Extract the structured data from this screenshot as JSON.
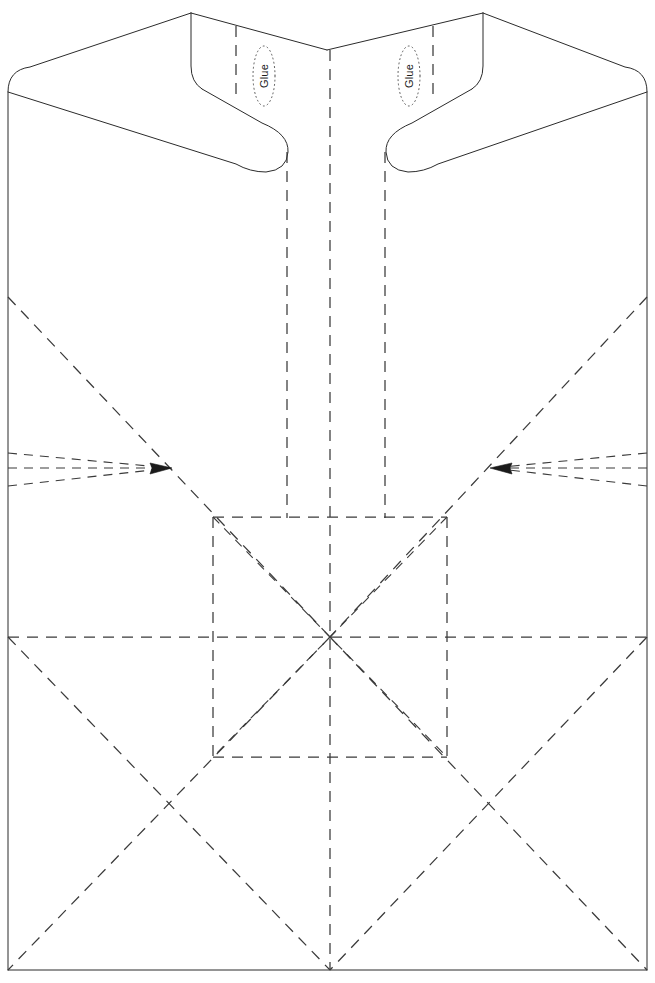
{
  "document": {
    "kind": "die-cut-template",
    "title": "Paper Gift Bag Template",
    "background_color": "#ffffff",
    "width": 655,
    "height": 983
  },
  "labels": {
    "glue_left": "Glue",
    "glue_right": "Glue"
  },
  "line_styles": {
    "cut_line": {
      "name": "cut",
      "color": "#2b2b2b",
      "pattern": "solid",
      "width": 1
    },
    "fold_line": {
      "name": "fold",
      "color": "#3a3a3a",
      "pattern": "dashed",
      "dash": "11 8",
      "width": 1.25
    },
    "glue_zone_outline": {
      "name": "glue-zone",
      "color": "#555555",
      "pattern": "dotted",
      "dash": "1 3.2",
      "width": 1
    }
  },
  "geometry": {
    "body": {
      "left_edge_x": 8,
      "right_edge_x": 647,
      "bottom_edge_y": 970,
      "top_left_corner": [
        8,
        70
      ],
      "top_right_corner": [
        647,
        70
      ],
      "corner_radius": 22
    },
    "outline_path": "M 8 970 L 8 92 Q 8 70 30 68 L 192 13 L 192 66 Q 192 88 207 93 L 275 131 Q 289 139 289 150 L 289 518 M 385 518 L 385 150 Q 385 139 399 131 L 467 93 Q 482 88 482 66 L 482 13 L 644 68 Q 665 70 647 92 L 647 970 Z",
    "top_notch_vertex": [
      327,
      50
    ],
    "flap_left": {
      "top_outer": [
        192,
        13
      ],
      "top_inner_vertex": [
        327,
        50
      ],
      "bottom_curve_start": [
        195,
        80
      ],
      "handle_end": [
        288,
        152
      ]
    },
    "flap_right": {
      "top_outer": [
        482,
        13
      ],
      "top_inner_vertex": [
        327,
        50
      ],
      "bottom_curve_start": [
        479,
        80
      ],
      "handle_end": [
        386,
        152
      ]
    },
    "center_square": {
      "x1": 213,
      "y1": 517,
      "x2": 447,
      "y2": 757,
      "center": [
        330,
        637
      ]
    },
    "vertical_folds_x": [
      287,
      330,
      385
    ],
    "horizontal_fold_y": 637,
    "upper_horizontal_fold_y": 517,
    "lower_horizontal_fold_y": 757,
    "arrow_tips": [
      [
        170,
        468
      ],
      [
        492,
        468
      ]
    ],
    "diagonal_origins": [
      [
        8,
        297
      ],
      [
        647,
        297
      ],
      [
        8,
        637
      ],
      [
        647,
        637
      ],
      [
        8,
        970
      ],
      [
        647,
        970
      ]
    ]
  },
  "annotations": {
    "glue_zone_left": {
      "cx": 264,
      "cy": 76,
      "rx": 11,
      "ry": 30
    },
    "glue_zone_right": {
      "cx": 409,
      "cy": 76,
      "rx": 11,
      "ry": 30
    }
  }
}
